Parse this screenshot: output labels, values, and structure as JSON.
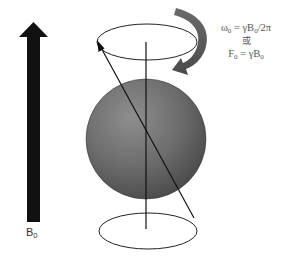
{
  "diagram": {
    "field_label": {
      "symbol": "B",
      "subscript": "0"
    },
    "formula": {
      "line1": {
        "lhs_symbol": "ω",
        "lhs_sub": "0",
        "rhs_prefix": " = γB",
        "rhs_sub": "0",
        "rhs_suffix": "/2π"
      },
      "line2": {
        "text": "或"
      },
      "line3": {
        "lhs_symbol": "F",
        "lhs_sub": "0",
        "rhs_prefix": " = γB",
        "rhs_sub": "0",
        "rhs_suffix": ""
      }
    },
    "colors": {
      "field_arrow": "#111111",
      "sphere_light": "#8a8a8a",
      "sphere_dark": "#4a4a4a",
      "rotation_arrow": "#5a5a5a",
      "lines": "#222222",
      "text": "#555555"
    },
    "elements": {
      "field_arrow": "B0 static magnetic field arrow (pointing up)",
      "sphere": "spinning nucleus",
      "axis": "precession axis",
      "magnetization_vector": "tilted spin vector",
      "top_orbit": "precession path (top)",
      "bottom_orbit": "precession path (bottom)",
      "rotation_arrow": "direction of precession"
    }
  }
}
